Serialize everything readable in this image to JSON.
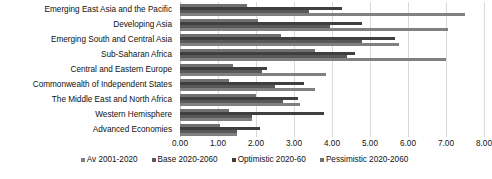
{
  "chart_data": {
    "type": "bar",
    "orientation": "horizontal",
    "title": "",
    "xlabel": "",
    "ylabel": "",
    "xlim": [
      0,
      8
    ],
    "xticks": [
      "0.00",
      "1.00",
      "2.00",
      "3.00",
      "4.00",
      "5.00",
      "6.00",
      "7.00",
      "8.00"
    ],
    "grid": true,
    "legend_position": "bottom",
    "categories": [
      "Emerging East Asia and the Pacific",
      "Developing Asia",
      "Emerging South and Central Asia",
      "Sub-Saharan Africa",
      "Central and Eastern Europe",
      "Commonwealth of Independent States",
      "The Middle East and North Africa",
      "Western Hemisphere",
      "Advanced Economies"
    ],
    "series": [
      {
        "name": "Av 2001-2020",
        "color": "#808080",
        "values": [
          7.5,
          7.05,
          5.75,
          7.0,
          3.85,
          3.55,
          3.15,
          1.9,
          1.5
        ]
      },
      {
        "name": "Base 2020-2060",
        "color": "#595959",
        "values": [
          3.4,
          3.95,
          4.8,
          4.4,
          2.15,
          2.5,
          2.7,
          1.9,
          1.5
        ]
      },
      {
        "name": "Optimistic 2020-60",
        "color": "#3f3f3f",
        "values": [
          4.25,
          4.8,
          5.65,
          4.6,
          2.3,
          3.25,
          3.1,
          3.8,
          2.1
        ]
      },
      {
        "name": "Pessimistic 2020-2060",
        "color": "#707070",
        "values": [
          1.75,
          2.05,
          2.65,
          3.55,
          1.4,
          1.3,
          2.0,
          1.3,
          1.05
        ]
      }
    ]
  }
}
